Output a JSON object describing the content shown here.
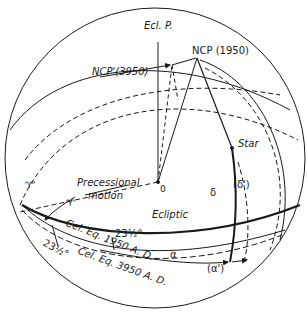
{
  "diagram": {
    "type": "celestial-sphere-precession",
    "colors": {
      "line": "#1a1a1a",
      "background": "#ffffff"
    },
    "labels": {
      "ecliptic_pole": "Ecl. P.",
      "ncp_1950": "NCP (1950)",
      "ncp_3950": "NCP'(3950)",
      "origin": "0",
      "star": "Star",
      "precessional_motion_line1": "Precessional",
      "precessional_motion_line2": "motion",
      "vernal_equinox": "♈",
      "vernal_equinox_prime": "♈'",
      "ecliptic": "Ecliptic",
      "obliquity_1": "23½°",
      "obliquity_2": "23½°",
      "celestial_equator_1950": "Cel. Eq. 1950 A. D.",
      "celestial_equator_3950": "Cel. Eq. 3950 A. D.",
      "declination": "δ",
      "declination_prime": "(δ')",
      "right_ascension": "α",
      "right_ascension_prime": "(α')"
    }
  }
}
